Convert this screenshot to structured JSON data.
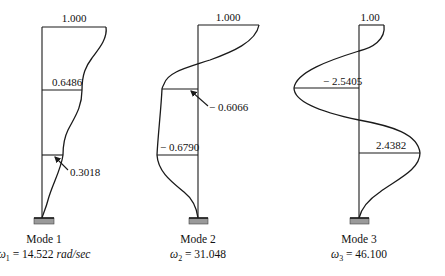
{
  "modes": [
    {
      "title": "Mode 1",
      "omega_symbol": "ω",
      "omega_sub": "1",
      "omega_eq": " = 14.522 ",
      "omega_unit": "rad/sec",
      "labels": {
        "top": "1.000",
        "mid": "0.6486",
        "low": "0.3018"
      }
    },
    {
      "title": "Mode 2",
      "omega_symbol": "ω",
      "omega_sub": "2",
      "omega_eq": " = 31.048",
      "omega_unit": "",
      "labels": {
        "top": "1.000",
        "mid": "− 0.6066",
        "low": "− 0.6790"
      }
    },
    {
      "title": "Mode 3",
      "omega_symbol": "ω",
      "omega_sub": "3",
      "omega_eq": " = 46.100",
      "omega_unit": "",
      "labels": {
        "top": "1.00",
        "mid": "− 2.5405",
        "low": "2.4382"
      }
    }
  ]
}
